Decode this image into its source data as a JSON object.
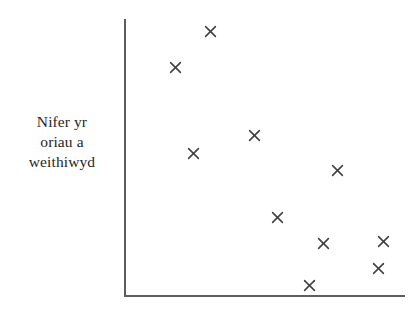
{
  "figure": {
    "background_color": "#ffffff",
    "axis_color": "#5d5d5d",
    "marker_color": "#3f3f3f",
    "marker_glyph": "x-cross-marker"
  },
  "y_axis_label": {
    "full_text": "Nifer yr oriau a weithiwyd",
    "lines": [
      "Nifer yr",
      "oriau a",
      "weithiwyd"
    ]
  },
  "chart_data": {
    "type": "scatter",
    "title": "",
    "xlabel": "",
    "ylabel": "Nifer yr oriau a weithiwyd",
    "grid": false,
    "legend": false,
    "axis_ticks": false,
    "axis_tick_labels": false,
    "xlim": [
      0,
      10
    ],
    "ylim": [
      0,
      10
    ],
    "series": [
      {
        "name": "",
        "marker": "x",
        "points": [
          {
            "x": 3.1,
            "y": 9.6
          },
          {
            "x": 1.8,
            "y": 8.3
          },
          {
            "x": 2.5,
            "y": 5.2
          },
          {
            "x": 4.6,
            "y": 5.8
          },
          {
            "x": 7.6,
            "y": 4.5
          },
          {
            "x": 5.4,
            "y": 2.8
          },
          {
            "x": 7.1,
            "y": 1.9
          },
          {
            "x": 9.2,
            "y": 2.0
          },
          {
            "x": 9.0,
            "y": 1.0
          },
          {
            "x": 6.6,
            "y": 0.4
          }
        ],
        "pixel_points": [
          {
            "px": 210,
            "py": 31
          },
          {
            "px": 175,
            "py": 67
          },
          {
            "px": 193,
            "py": 153
          },
          {
            "px": 254,
            "py": 135
          },
          {
            "px": 337,
            "py": 170
          },
          {
            "px": 277,
            "py": 217
          },
          {
            "px": 323,
            "py": 243
          },
          {
            "px": 383,
            "py": 241
          },
          {
            "px": 378,
            "py": 268
          },
          {
            "px": 309,
            "py": 285
          }
        ]
      }
    ]
  }
}
